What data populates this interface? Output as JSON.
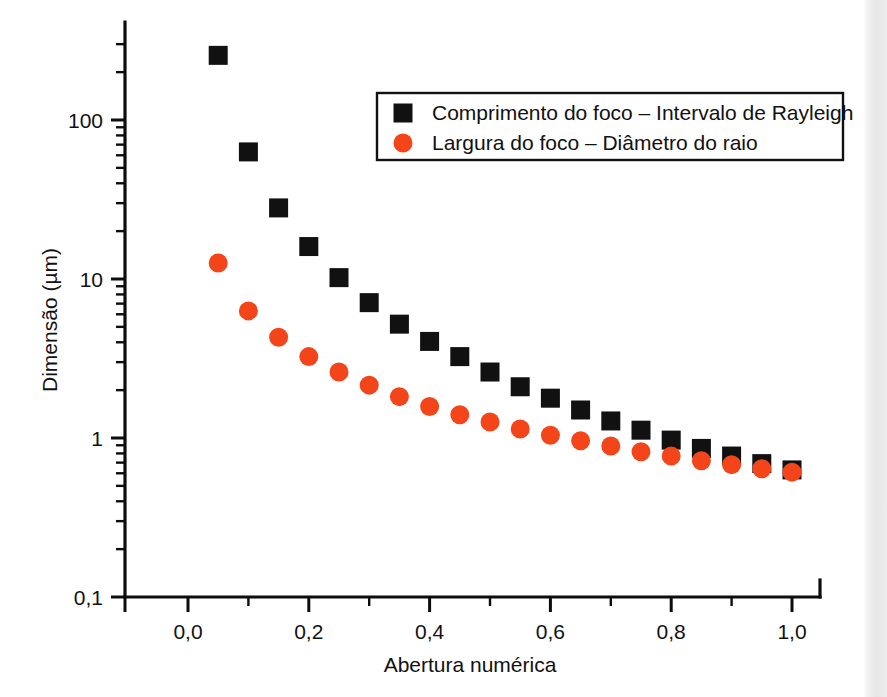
{
  "figure": {
    "background_color": "#ffffff",
    "page_edge_color": "#e6e6e6"
  },
  "chart_data": {
    "type": "scatter",
    "title": "",
    "xlabel": "Abertura numérica",
    "ylabel": "Dimensão (µm)",
    "xlim": [
      -0.06,
      1.1
    ],
    "ylim": [
      0.1,
      400
    ],
    "yscale": "log",
    "xscale": "linear",
    "grid": false,
    "legend_position": "upper right",
    "x_ticks": [
      0.0,
      0.2,
      0.4,
      0.6,
      0.8,
      1.0
    ],
    "x_tick_labels": [
      "0,0",
      "0,2",
      "0,4",
      "0,6",
      "0,8",
      "1,0"
    ],
    "x_minor_ticks": [
      0.1,
      0.3,
      0.5,
      0.7,
      0.9,
      1.1
    ],
    "y_ticks": [
      0.1,
      1,
      10,
      100
    ],
    "y_tick_labels": [
      "0,1",
      "1",
      "10",
      "100"
    ],
    "x": [
      0.05,
      0.1,
      0.15,
      0.2,
      0.25,
      0.3,
      0.35,
      0.4,
      0.45,
      0.5,
      0.55,
      0.6,
      0.65,
      0.7,
      0.75,
      0.8,
      0.85,
      0.9,
      0.95,
      1.0
    ],
    "series": [
      {
        "name": "Comprimento do foco – Intervalo de Rayleigh",
        "marker": "square",
        "color": "#111111",
        "values": [
          255.0,
          63.0,
          28.0,
          16.0,
          10.2,
          7.1,
          5.2,
          4.05,
          3.25,
          2.6,
          2.1,
          1.78,
          1.5,
          1.28,
          1.12,
          0.97,
          0.86,
          0.77,
          0.69,
          0.63
        ]
      },
      {
        "name": "Largura do foco – Diâmetro do raio",
        "marker": "circle",
        "color": "#f4441a",
        "values": [
          12.6,
          6.3,
          4.3,
          3.25,
          2.6,
          2.15,
          1.82,
          1.58,
          1.4,
          1.26,
          1.14,
          1.04,
          0.96,
          0.89,
          0.82,
          0.77,
          0.72,
          0.68,
          0.64,
          0.61
        ]
      }
    ],
    "legend": [
      {
        "label": "Comprimento do foco – Intervalo de Rayleigh",
        "marker": "square",
        "color": "#111111"
      },
      {
        "label": "Largura do foco – Diâmetro do raio",
        "marker": "circle",
        "color": "#f4441a"
      }
    ]
  }
}
